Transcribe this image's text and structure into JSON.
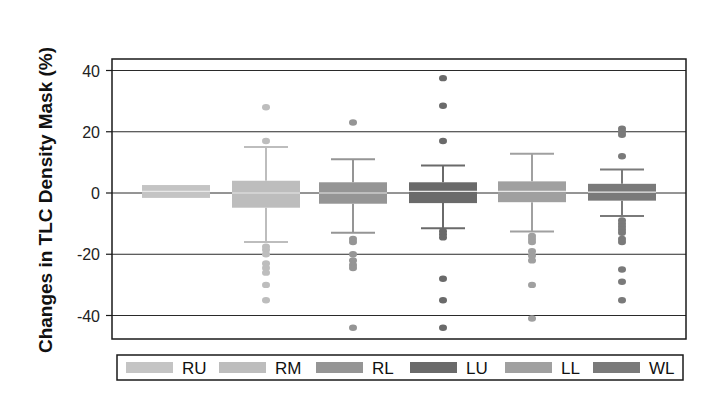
{
  "chart_data": {
    "type": "box",
    "title": "",
    "xlabel": "",
    "ylabel": "Changes in TLC Density Mask (%)",
    "ylim": [
      -48,
      44
    ],
    "yticks": [
      40,
      20,
      0,
      -20,
      -40
    ],
    "grid": true,
    "legend_position": "bottom",
    "categories": [
      "RU",
      "RM",
      "RL",
      "LU",
      "LL",
      "WL"
    ],
    "series": [
      {
        "name": "RU",
        "color": "#c4c4c4",
        "q1": -1.6,
        "median": 0.5,
        "q3": 2.6,
        "whisker_low": null,
        "whisker_high": null,
        "outliers": []
      },
      {
        "name": "RM",
        "color": "#bdbdbd",
        "q1": -4.8,
        "median": 0.0,
        "q3": 4.0,
        "whisker_low": -16.0,
        "whisker_high": 15.0,
        "outliers": [
          28,
          17,
          -17.5,
          -18.5,
          -20,
          -23,
          -24.5,
          -26,
          -30,
          -35
        ]
      },
      {
        "name": "RL",
        "color": "#959595",
        "q1": -3.5,
        "median": 0.0,
        "q3": 3.5,
        "whisker_low": -13.0,
        "whisker_high": 11.0,
        "outliers": [
          23,
          -15,
          -16,
          -20,
          -22,
          -23.5,
          -24.5,
          -44
        ]
      },
      {
        "name": "LU",
        "color": "#6a6a6a",
        "q1": -3.3,
        "median": 0.5,
        "q3": 3.5,
        "whisker_low": -11.5,
        "whisker_high": 9.0,
        "outliers": [
          37.5,
          28.5,
          17,
          -12.5,
          -13.5,
          -14.5,
          -28,
          -35,
          -44
        ]
      },
      {
        "name": "LL",
        "color": "#a0a0a0",
        "q1": -3.0,
        "median": 0.5,
        "q3": 3.8,
        "whisker_low": -12.6,
        "whisker_high": 12.8,
        "outliers": [
          -14,
          -15,
          -16,
          -19,
          -20.5,
          -22,
          -30,
          -41
        ]
      },
      {
        "name": "WL",
        "color": "#7a7a7a",
        "q1": -2.5,
        "median": 0.3,
        "q3": 3.0,
        "whisker_low": -7.5,
        "whisker_high": 7.7,
        "outliers": [
          21,
          20,
          19,
          12,
          -9,
          -10,
          -11,
          -12,
          -13,
          -15,
          -16,
          -25,
          -29,
          -35
        ]
      }
    ]
  },
  "axis": {
    "ylabel": "Changes in TLC Density Mask (%)",
    "tick_labels": [
      "40",
      "20",
      "0",
      "-20",
      "-40"
    ]
  },
  "legend": {
    "items": [
      {
        "label": "RU",
        "color": "#c4c4c4"
      },
      {
        "label": "RM",
        "color": "#bdbdbd"
      },
      {
        "label": "RL",
        "color": "#959595"
      },
      {
        "label": "LU",
        "color": "#6a6a6a"
      },
      {
        "label": "LL",
        "color": "#a0a0a0"
      },
      {
        "label": "WL",
        "color": "#7a7a7a"
      }
    ]
  }
}
